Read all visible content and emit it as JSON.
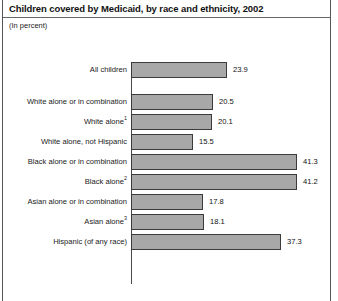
{
  "header": {
    "title": "Children covered by Medicaid, by race and ethnicity, 2002",
    "subtitle": "(In percent)"
  },
  "style": {
    "bar_fill": "#a8a8a8",
    "bar_stroke": "#3c3c3c",
    "axis_color": "#4a4a4a",
    "text_color": "#1a1a1a",
    "background": "#ffffff"
  },
  "chart_data": {
    "type": "bar",
    "orientation": "horizontal",
    "title": "Children covered by Medicaid, by race and ethnicity, 2002",
    "subtitle": "(In percent)",
    "xlabel": "",
    "ylabel": "",
    "xlim": [
      0,
      45
    ],
    "grid": false,
    "legend": null,
    "value_labels": true,
    "categories": [
      "All children",
      "White alone or in combination",
      "White alone",
      "White alone, not Hispanic",
      "Black alone or in combination",
      "Black alone",
      "Asian alone or in combination",
      "Asian alone",
      "Hispanic (of any race)"
    ],
    "values": [
      23.9,
      20.5,
      20.1,
      15.5,
      41.3,
      41.2,
      17.8,
      18.1,
      37.3
    ],
    "bars": [
      {
        "label": "All children",
        "footnote": "",
        "value": 23.9,
        "value_text": "23.9",
        "group_break_after": true
      },
      {
        "label": "White alone or in combination",
        "footnote": "",
        "value": 20.5,
        "value_text": "20.5",
        "group_break_after": false
      },
      {
        "label": "White alone",
        "footnote": "1",
        "value": 20.1,
        "value_text": "20.1",
        "group_break_after": false
      },
      {
        "label": "White alone, not Hispanic",
        "footnote": "",
        "value": 15.5,
        "value_text": "15.5",
        "group_break_after": false
      },
      {
        "label": "Black alone or in combination",
        "footnote": "",
        "value": 41.3,
        "value_text": "41.3",
        "group_break_after": false
      },
      {
        "label": "Black alone",
        "footnote": "2",
        "value": 41.2,
        "value_text": "41.2",
        "group_break_after": false
      },
      {
        "label": "Asian alone or in combination",
        "footnote": "",
        "value": 17.8,
        "value_text": "17.8",
        "group_break_after": false
      },
      {
        "label": "Asian alone",
        "footnote": "3",
        "value": 18.1,
        "value_text": "18.1",
        "group_break_after": false
      },
      {
        "label": "Hispanic (of any race)",
        "footnote": "",
        "value": 37.3,
        "value_text": "37.3",
        "group_break_after": false
      }
    ]
  }
}
